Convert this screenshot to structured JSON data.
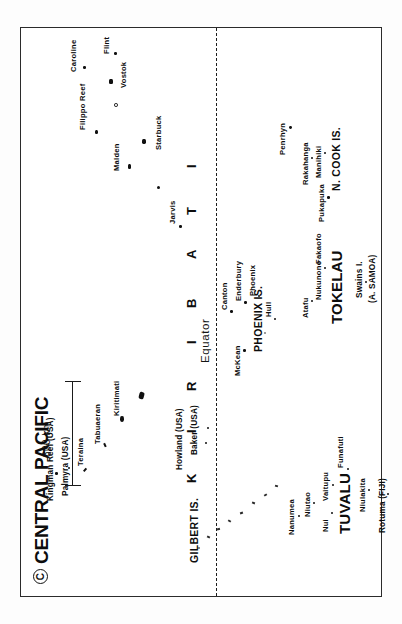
{
  "map": {
    "title": "CENTRAL PACIFIC",
    "copyright_mark": "C",
    "equator_label": "Equator",
    "scale_label": "800 km",
    "country_spread": "K I R I B A T I",
    "spread_letters": [
      "K",
      "I",
      "R",
      "I",
      "B",
      "A",
      "T",
      "I"
    ]
  },
  "countries": [
    {
      "name": "TUVALU"
    },
    {
      "name": "TOKELAU"
    }
  ],
  "groups": [
    {
      "name": "GILBERT IS."
    },
    {
      "name": "PHOENIX IS."
    },
    {
      "name": "N. COOK IS."
    }
  ],
  "territories": [
    {
      "name": "Kingman Reef (USA)"
    },
    {
      "name": "Palmyra (USA)"
    },
    {
      "name": "Howland (USA)"
    },
    {
      "name": "Baker (USA)"
    },
    {
      "name": "Swains I."
    },
    {
      "name": "(A. SAMOA)"
    },
    {
      "name": "Rotuma (FIJI)"
    }
  ],
  "islands": [
    {
      "name": "Teraina"
    },
    {
      "name": "Tabuaeran"
    },
    {
      "name": "Kiritimati"
    },
    {
      "name": "Jarvis"
    },
    {
      "name": "Malden"
    },
    {
      "name": "Starbuck"
    },
    {
      "name": "Filippo Reef"
    },
    {
      "name": "Vostok"
    },
    {
      "name": "Caroline"
    },
    {
      "name": "Flint"
    },
    {
      "name": "McKean"
    },
    {
      "name": "Canton"
    },
    {
      "name": "Enderbury"
    },
    {
      "name": "Phoenix"
    },
    {
      "name": "Hull"
    },
    {
      "name": "Nanumea"
    },
    {
      "name": "Niutao"
    },
    {
      "name": "Nui"
    },
    {
      "name": "Vaitupu"
    },
    {
      "name": "Funafuti"
    },
    {
      "name": "Niulakita"
    },
    {
      "name": "Atafu"
    },
    {
      "name": "Nukunono"
    },
    {
      "name": "Fakaofo"
    },
    {
      "name": "Pukapuka"
    },
    {
      "name": "Rakahanga"
    },
    {
      "name": "Manihiki"
    },
    {
      "name": "Penrhyn"
    }
  ],
  "colors": {
    "ink": "#101010",
    "paper": "#ffffff",
    "border": "#2b2b2b"
  }
}
